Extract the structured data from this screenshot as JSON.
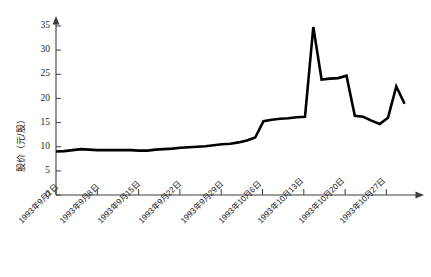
{
  "chart_data": {
    "type": "line",
    "title": "",
    "subtitle": "",
    "xlabel": "",
    "ylabel": "股价（元/股）",
    "ylim": [
      0,
      37
    ],
    "yticks": [
      0,
      5,
      10,
      15,
      20,
      25,
      30,
      35
    ],
    "ytick_labels": [
      "0",
      "5",
      "10",
      "15",
      "20",
      "25",
      "30",
      "35"
    ],
    "grid": false,
    "legend": null,
    "xtick_labels": [
      "1993年9月1日",
      "1993年9月8日",
      "1993年9月15日",
      "1993年9月22日",
      "1993年9月29日",
      "1993年10月6日",
      "1993年10月13日",
      "1993年10月20日",
      "1993年10月27日"
    ],
    "xtick_positions": [
      0,
      5,
      10,
      15,
      20,
      25,
      30,
      35,
      40
    ],
    "x": [
      0,
      1,
      2,
      3,
      4,
      5,
      6,
      7,
      8,
      9,
      10,
      11,
      12,
      13,
      14,
      15,
      16,
      17,
      18,
      19,
      20,
      21,
      22,
      23,
      24,
      25,
      26,
      27,
      28,
      29,
      30,
      31,
      32,
      33,
      34,
      35,
      36,
      37,
      38,
      39,
      40,
      41,
      42
    ],
    "values": [
      9.0,
      9.1,
      9.3,
      9.5,
      9.4,
      9.3,
      9.3,
      9.3,
      9.3,
      9.3,
      9.2,
      9.2,
      9.4,
      9.5,
      9.6,
      9.8,
      9.9,
      10.0,
      10.1,
      10.3,
      10.5,
      10.6,
      10.9,
      11.3,
      11.9,
      15.3,
      15.6,
      15.8,
      15.9,
      16.1,
      16.2,
      34.8,
      23.9,
      24.1,
      24.2,
      24.7,
      16.4,
      16.2,
      15.4,
      14.7,
      16.0,
      22.5,
      18.9
    ],
    "series_name": "股价",
    "line_color": "#000000",
    "axis_color": "#3d3d3d",
    "background_color": "#ffffff"
  },
  "figure": {
    "caption": ""
  }
}
